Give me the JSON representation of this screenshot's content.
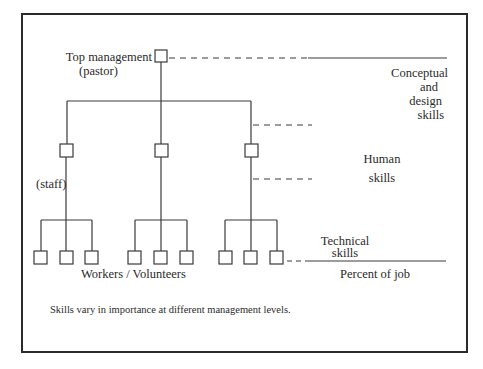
{
  "diagram": {
    "title": "Skills vary in importance at different management levels.",
    "levels": {
      "top": {
        "label_line1": "Top management",
        "label_line2": "(pastor)"
      },
      "middle": {
        "label": "(staff)"
      },
      "bottom": {
        "label": "Workers / Volunteers"
      }
    },
    "skills": {
      "conceptual": [
        "Conceptual",
        "and",
        "design",
        "skills"
      ],
      "human": [
        "Human",
        "skills"
      ],
      "technical": [
        "Technical",
        "skills"
      ],
      "axis_label": "Percent of job"
    },
    "structure": {
      "top_nodes": 1,
      "middle_nodes": 3,
      "bottom_nodes_per_middle": 3
    },
    "colors": {
      "line": "#3a3a3a",
      "frame": "#2b2b2b",
      "background": "#ffffff"
    }
  }
}
